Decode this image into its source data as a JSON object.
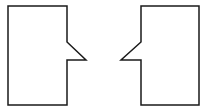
{
  "diagram": {
    "background": "#ffffff",
    "stroke": "#1a1a1a",
    "stroke_width": 1.5,
    "shapes": [
      {
        "name": "left-callout-shape",
        "points": "8,6 67,6 67,42 86,60 67,60 67,105 8,105"
      },
      {
        "name": "right-callout-shape",
        "points": "141,6 199,6 199,105 141,105 141,60 121,60 141,42"
      }
    ]
  }
}
